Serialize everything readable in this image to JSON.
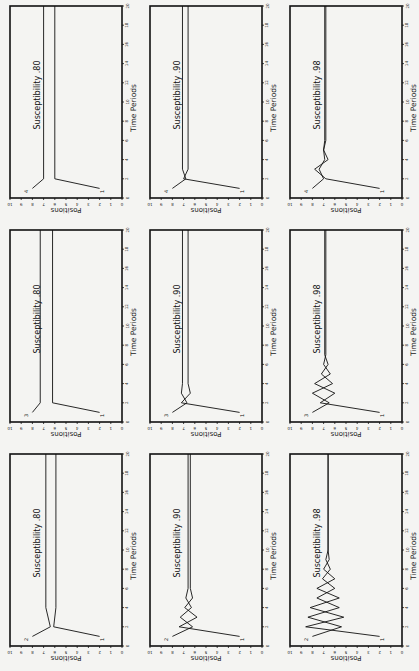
{
  "figure": {
    "orientation": "rotated-90",
    "ylabel": "Positions",
    "xlabel": "Time Periods",
    "y_ticks": [
      0,
      1,
      2,
      3,
      4,
      5,
      6,
      7,
      8,
      9,
      10
    ],
    "x_ticks": [
      0,
      2,
      4,
      6,
      8,
      10,
      12,
      14,
      16,
      18,
      20
    ]
  },
  "chart_data": [
    {
      "type": "line",
      "title": "Susceptibility .80",
      "row": 0,
      "col": 0,
      "xlabel": "Time Periods",
      "ylabel": "Positions",
      "xlim": [
        0,
        20
      ],
      "ylim": [
        0,
        10
      ],
      "series": [
        {
          "name": "4",
          "x": [
            1,
            2,
            20
          ],
          "values": [
            8,
            7,
            7
          ]
        },
        {
          "name": "1",
          "x": [
            1,
            2,
            20
          ],
          "values": [
            2,
            6,
            6
          ]
        }
      ]
    },
    {
      "type": "line",
      "title": "Susceptibility .90",
      "row": 0,
      "col": 1,
      "xlabel": "Time Periods",
      "ylabel": "Positions",
      "xlim": [
        0,
        20
      ],
      "ylim": [
        0,
        10
      ],
      "series": [
        {
          "name": "4",
          "x": [
            1,
            2,
            3,
            20
          ],
          "values": [
            8,
            6.8,
            7.1,
            7.1
          ]
        },
        {
          "name": "1",
          "x": [
            1,
            2,
            3,
            20
          ],
          "values": [
            2,
            7,
            6.6,
            6.6
          ]
        }
      ]
    },
    {
      "type": "line",
      "title": "Susceptibility .98",
      "row": 0,
      "col": 2,
      "xlabel": "Time Periods",
      "ylabel": "Positions",
      "xlim": [
        0,
        20
      ],
      "ylim": [
        0,
        10
      ],
      "series": [
        {
          "name": "4",
          "x": [
            1,
            2,
            3,
            4,
            5,
            6,
            20
          ],
          "values": [
            8,
            7.0,
            7.4,
            6.9,
            7.0,
            6.9,
            6.9
          ]
        },
        {
          "name": "1",
          "x": [
            1,
            2,
            3,
            4,
            5,
            6,
            20
          ],
          "values": [
            2,
            6.8,
            7.8,
            6.6,
            7.0,
            6.8,
            6.8
          ]
        }
      ]
    },
    {
      "type": "line",
      "title": "Susceptibility .80",
      "row": 1,
      "col": 0,
      "xlabel": "Time Periods",
      "ylabel": "Positions",
      "xlim": [
        0,
        20
      ],
      "ylim": [
        0,
        10
      ],
      "series": [
        {
          "name": "3",
          "x": [
            1,
            2,
            20
          ],
          "values": [
            8,
            7.3,
            7.3
          ]
        },
        {
          "name": "1",
          "x": [
            1,
            2,
            20
          ],
          "values": [
            2,
            6.2,
            6.2
          ]
        }
      ]
    },
    {
      "type": "line",
      "title": "Susceptibility .90",
      "row": 1,
      "col": 1,
      "xlabel": "Time Periods",
      "ylabel": "Positions",
      "xlim": [
        0,
        20
      ],
      "ylim": [
        0,
        10
      ],
      "series": [
        {
          "name": "3",
          "x": [
            1,
            2,
            3,
            4,
            20
          ],
          "values": [
            8,
            6.7,
            7.2,
            7.1,
            7.1
          ]
        },
        {
          "name": "1",
          "x": [
            1,
            2,
            3,
            4,
            20
          ],
          "values": [
            2,
            7.2,
            6.4,
            6.6,
            6.6
          ]
        }
      ]
    },
    {
      "type": "line",
      "title": "Susceptibility .98",
      "row": 1,
      "col": 2,
      "xlabel": "Time Periods",
      "ylabel": "Positions",
      "xlim": [
        0,
        20
      ],
      "ylim": [
        0,
        10
      ],
      "series": [
        {
          "name": "3",
          "x": [
            1,
            2,
            3,
            4,
            5,
            6,
            7,
            20
          ],
          "values": [
            8,
            6.5,
            8.0,
            6.2,
            7.2,
            6.6,
            6.9,
            6.9
          ]
        },
        {
          "name": "1",
          "x": [
            1,
            2,
            3,
            4,
            5,
            6,
            7,
            20
          ],
          "values": [
            2,
            7.3,
            6.0,
            7.8,
            6.4,
            7.0,
            6.8,
            6.8
          ]
        }
      ]
    },
    {
      "type": "line",
      "title": "Susceptibility .80",
      "row": 2,
      "col": 0,
      "xlabel": "Time Periods",
      "ylabel": "Positions",
      "xlim": [
        0,
        20
      ],
      "ylim": [
        0,
        10
      ],
      "series": [
        {
          "name": "2",
          "x": [
            1,
            2,
            4,
            20
          ],
          "values": [
            8,
            6.4,
            6.8,
            6.8
          ]
        },
        {
          "name": "1",
          "x": [
            1,
            2,
            4,
            20
          ],
          "values": [
            2,
            6.1,
            5.9,
            5.9
          ]
        }
      ]
    },
    {
      "type": "line",
      "title": "Susceptibility .90",
      "row": 2,
      "col": 1,
      "xlabel": "Time Periods",
      "ylabel": "Positions",
      "xlim": [
        0,
        20
      ],
      "ylim": [
        0,
        10
      ],
      "series": [
        {
          "name": "2",
          "x": [
            1,
            2,
            3,
            4,
            5,
            6,
            20
          ],
          "values": [
            8,
            6.2,
            7.3,
            6.3,
            6.8,
            6.6,
            6.6
          ]
        },
        {
          "name": "1",
          "x": [
            1,
            2,
            3,
            4,
            5,
            6,
            20
          ],
          "values": [
            2,
            7.4,
            5.8,
            6.9,
            6.2,
            6.4,
            6.4
          ]
        }
      ]
    },
    {
      "type": "line",
      "title": "Susceptibility .98",
      "row": 2,
      "col": 2,
      "xlabel": "Time Periods",
      "ylabel": "Positions",
      "xlim": [
        0,
        20
      ],
      "ylim": [
        0,
        10
      ],
      "series": [
        {
          "name": "2",
          "x": [
            1,
            2,
            3,
            4,
            5,
            6,
            7,
            8,
            9,
            10,
            20
          ],
          "values": [
            8,
            5.4,
            8.4,
            5.6,
            7.6,
            6.0,
            7.1,
            6.4,
            6.8,
            6.6,
            6.6
          ]
        },
        {
          "name": "1",
          "x": [
            1,
            2,
            3,
            4,
            5,
            6,
            7,
            8,
            9,
            10,
            20
          ],
          "values": [
            2,
            8.6,
            5.2,
            8.2,
            5.6,
            7.6,
            6.0,
            7.0,
            6.5,
            6.6,
            6.6
          ]
        }
      ]
    }
  ]
}
